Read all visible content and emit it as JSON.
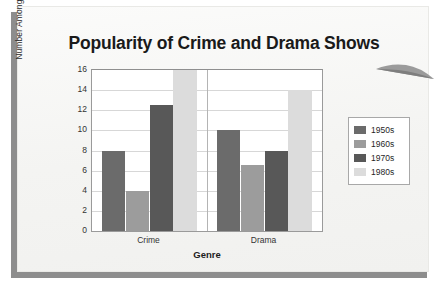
{
  "chart_data": {
    "type": "bar",
    "title": "Popularity of Crime and Drama Shows",
    "xlabel": "Genre",
    "ylabel": "Number Among Top 100",
    "categories": [
      "Crime",
      "Drama"
    ],
    "series": [
      {
        "name": "1950s",
        "values": [
          8,
          10
        ],
        "color": "#6b6b6b"
      },
      {
        "name": "1960s",
        "values": [
          4,
          6.6
        ],
        "color": "#9c9c9c"
      },
      {
        "name": "1970s",
        "values": [
          12.5,
          8
        ],
        "color": "#585858"
      },
      {
        "name": "1980s",
        "values": [
          16,
          14
        ],
        "color": "#dcdcdc"
      }
    ],
    "ylim": [
      0,
      16
    ],
    "yticks": [
      0,
      2,
      4,
      6,
      8,
      10,
      12,
      14,
      16
    ],
    "ytick_labels": [
      "0",
      "2",
      "4",
      "6",
      "8",
      "10",
      "12",
      "14",
      "16"
    ],
    "grid": true,
    "legend_position": "right"
  },
  "colors": {
    "plot_background": "#ffffff",
    "paper_background": "#f7f7f5",
    "shadow": "#8d8d8d",
    "gridline": "#d7d7d7",
    "axis": "#9a9a9a",
    "title_text": "#1a1a1a"
  }
}
